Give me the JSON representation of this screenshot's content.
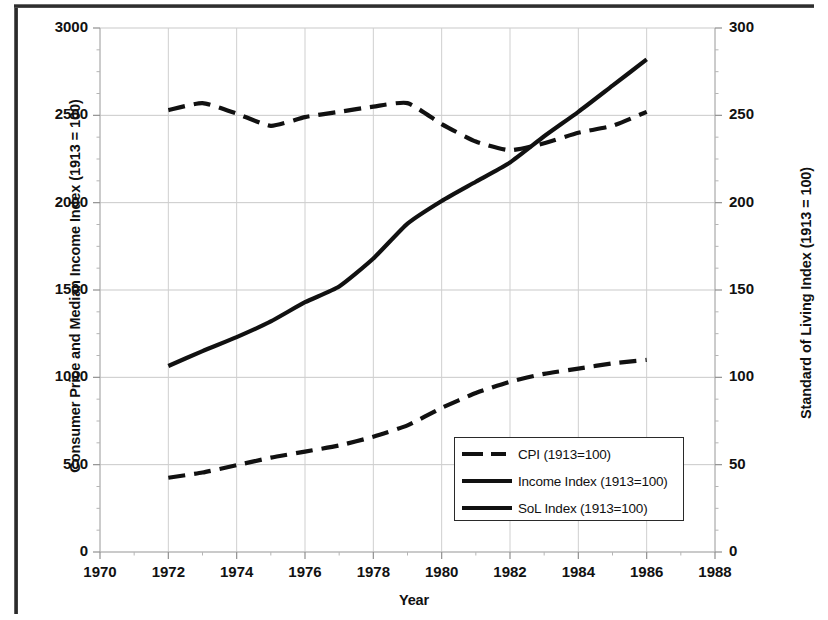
{
  "chart_data": {
    "type": "line",
    "title": "",
    "xlabel": "Year",
    "ylabel": "Consumer Price and Median Income Index (1913 = 100)",
    "ylabel_secondary": "Standard of Living Index (1913 = 100)",
    "xlim": [
      1970,
      1988
    ],
    "ylim": [
      0,
      3000
    ],
    "ylim_secondary": [
      0,
      300
    ],
    "xticks": [
      "1970",
      "1972",
      "1974",
      "1976",
      "1978",
      "1980",
      "1982",
      "1984",
      "1986",
      "1988"
    ],
    "yticks_left": [
      "0",
      "500",
      "1000",
      "1500",
      "2000",
      "2500",
      "3000"
    ],
    "yticks_right": [
      "0",
      "50",
      "100",
      "150",
      "200",
      "250",
      "300"
    ],
    "grid": true,
    "legend_position": "center-right-lower",
    "x": [
      1972,
      1973,
      1974,
      1975,
      1976,
      1977,
      1978,
      1979,
      1980,
      1981,
      1982,
      1983,
      1984,
      1985,
      1986
    ],
    "series": [
      {
        "name": "CPI (1913=100)",
        "axis": "left",
        "style": "dashed",
        "color": "#111111",
        "values": [
          425,
          455,
          497,
          540,
          575,
          610,
          660,
          725,
          825,
          910,
          975,
          1020,
          1050,
          1080,
          1100
        ]
      },
      {
        "name": "Income Index (1913=100)",
        "axis": "left",
        "style": "solid",
        "color": "#111111",
        "values": [
          1065,
          1150,
          1230,
          1320,
          1430,
          1520,
          1680,
          1880,
          2010,
          2120,
          2230,
          2380,
          2520,
          2670,
          2820
        ]
      },
      {
        "name": "SoL Index (1913=100)",
        "axis": "right",
        "style": "dashed",
        "color": "#111111",
        "values": [
          253,
          257,
          251,
          244,
          249,
          252,
          255,
          257,
          245,
          235,
          230,
          234,
          240,
          244,
          252
        ]
      }
    ]
  },
  "axes": {
    "xlabel": "Year",
    "ylabel_left": "Consumer Price and Median Income Index (1913 = 100)",
    "ylabel_right": "Standard of Living Index (1913 = 100)"
  },
  "legend": {
    "items": [
      {
        "label": "CPI (1913=100)",
        "style": "dashed"
      },
      {
        "label": "Income Index (1913=100)",
        "style": "solid"
      },
      {
        "label": "SoL Index (1913=100)",
        "style": "solid"
      }
    ]
  }
}
